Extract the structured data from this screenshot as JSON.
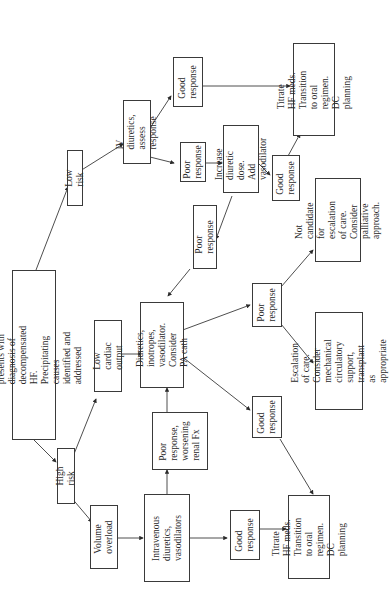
{
  "diagram": {
    "orientation": "rotated 90 degrees counter-clockwise",
    "line_color": "#3a3a3a",
    "nodes": {
      "start": "Patient presents with diagnosis of\ndecompensated HF. Precipitating causes\nidentified and addressed",
      "high_risk": "High risk",
      "low_risk": "Low risk",
      "volume_overload": "Volume\noverload",
      "low_cardiac_output": "Low cardiac\noutput",
      "iv_diuretics_vasodilators": "Intravenous\ndiuretics,\nvasodilators",
      "poor_response_worsening_renal": "Poor\nresponse,\nworsening\nrenal Fx",
      "diuretics_inotropes": "Diuretics, inotropes,\nvasodilator.\nConsider PA cath",
      "good_response_high": "Good\nresponse",
      "titrate_high": "Titrate HF meds.\nTransition to oral\nregimen. DC planning",
      "good_response_mid": "Good\nresponse",
      "poor_response_mid": "Poor\nresponse",
      "escalation_of_care": "Escalation of care.\nConsider mechanical\ncirculatory support,\ntransplant as appropriate",
      "not_candidate": "Not candidate for\nescalation of care.\nConsider palliative\napproach.",
      "iv_diuretics_assess": "IV diuretics,\nassess response",
      "good_response_low": "Good\nresponse",
      "poor_response_low": "Poor\nresponse",
      "increase_diuretic": "Increase\ndiuretic dose.\nAdd vasodilator",
      "good_response_low2": "Good\nresponse",
      "poor_response_low2": "Poor response",
      "titrate_low": "Titrate HF meds.\nTransition to oral\nregimen. DC planning"
    }
  }
}
